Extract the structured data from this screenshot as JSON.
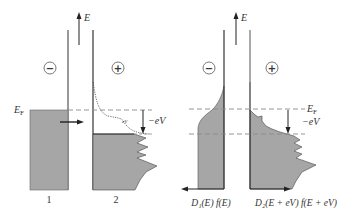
{
  "figure": {
    "left_panel": {
      "energy_axis_label": "E",
      "fermi_label": "E",
      "fermi_subscript": "F",
      "bias_label": "−eV",
      "electrode_1_sign": "−",
      "electrode_2_sign": "+",
      "electrode_1_label": "1",
      "electrode_2_label": "2"
    },
    "right_panel": {
      "energy_axis_label": "E",
      "fermi_label": "E",
      "fermi_subscript": "F",
      "bias_label": "−eV",
      "electrode_1_sign": "−",
      "electrode_2_sign": "+",
      "dos_1_label": "D₁(E) f(E)",
      "dos_2_label": "D₂(E + eV) f(E + eV)"
    },
    "colors": {
      "fill": "#a6a6a6",
      "line": "#333333",
      "dashed": "#8a8a8a"
    }
  }
}
